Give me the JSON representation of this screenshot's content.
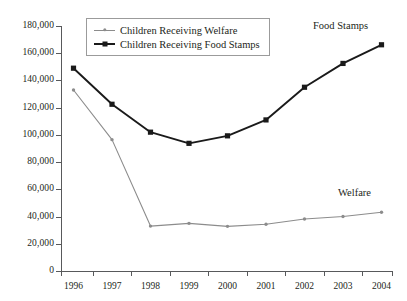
{
  "chart_data": {
    "type": "line",
    "title": "",
    "subtitle": "",
    "xlabel": "",
    "ylabel": "",
    "categories": [
      "1996",
      "1997",
      "1998",
      "1999",
      "2000",
      "2001",
      "2002",
      "2003",
      "2004"
    ],
    "x": [
      1996,
      1997,
      1998,
      1999,
      2000,
      2001,
      2002,
      2003,
      2004
    ],
    "ylim": [
      0,
      180000
    ],
    "yticks": [
      0,
      20000,
      40000,
      60000,
      80000,
      100000,
      120000,
      140000,
      160000,
      180000
    ],
    "ytick_labels": [
      "0",
      "20,000",
      "40,000",
      "60,000",
      "80,000",
      "100,000",
      "120,000",
      "140,000",
      "160,000",
      "180,000"
    ],
    "grid": false,
    "legend_position": "top-left-inside",
    "series": [
      {
        "name": "Children Receiving Welfare",
        "values": [
          133000,
          96500,
          33000,
          35000,
          32800,
          34400,
          38200,
          40000,
          43200
        ],
        "color": "#8c8c8c",
        "marker": "dot"
      },
      {
        "name": "Children Receiving Food Stamps",
        "values": [
          149000,
          122500,
          102000,
          93800,
          99300,
          111000,
          135000,
          152500,
          166200
        ],
        "color": "#1a1a1a",
        "marker": "square"
      }
    ],
    "annotations": [
      {
        "text": "Food Stamps",
        "series": "Children Receiving Food Stamps"
      },
      {
        "text": "Welfare",
        "series": "Children Receiving Welfare"
      }
    ]
  },
  "legend": {
    "entries": [
      {
        "label": "Children Receiving Welfare"
      },
      {
        "label": "Children Receiving Food Stamps"
      }
    ]
  },
  "axis": {
    "y_labels": [
      "180,000",
      "160,000",
      "140,000",
      "120,000",
      "100,000",
      "80,000",
      "60,000",
      "40,000",
      "20,000",
      "0"
    ],
    "x_labels": [
      "1996",
      "1997",
      "1998",
      "1999",
      "2000",
      "2001",
      "2002",
      "2003",
      "2004"
    ]
  },
  "annotations": {
    "food_stamps": "Food Stamps",
    "welfare": "Welfare"
  },
  "colors": {
    "welfare": "#8c8c8c",
    "food_stamps": "#1a1a1a",
    "axis": "#58595b",
    "text": "#231f20",
    "legend_border": "#9b9b9b",
    "background": "#ffffff"
  }
}
